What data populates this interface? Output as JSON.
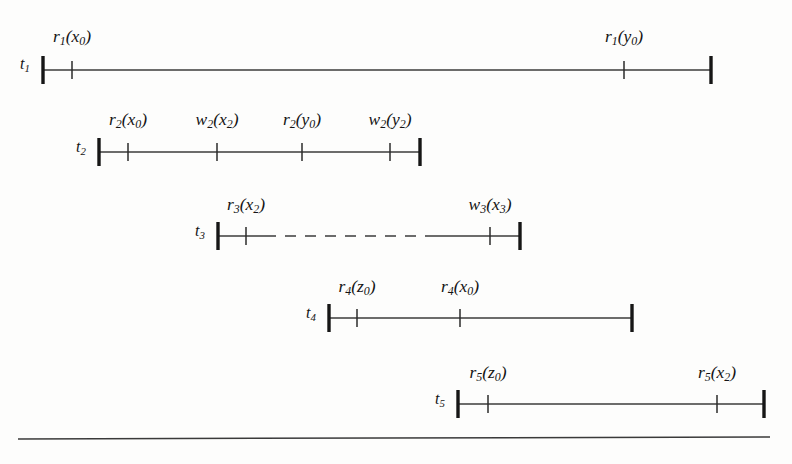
{
  "figure": {
    "type": "timeline-schedule-diagram",
    "background_color": "#fdfdfc",
    "line_color": "#3b3b3b",
    "endcap_color": "#161616",
    "width": 792,
    "height": 464,
    "bottom_rule": {
      "x1": 18,
      "y1": 439,
      "x2": 770,
      "y2": 437
    },
    "timelines": [
      {
        "id": "t1",
        "row_label": "t",
        "row_sub": "1",
        "row_label_x": 20,
        "row_label_y": 56,
        "baseline_y": 70,
        "x_start": 43,
        "x_end": 711,
        "dashed_segment": null,
        "events": [
          {
            "op": "r",
            "op_sub": "1",
            "arg": "x",
            "arg_sub": "0",
            "x": 72,
            "label_y": 28
          },
          {
            "op": "r",
            "op_sub": "1",
            "arg": "y",
            "arg_sub": "0",
            "x": 624,
            "label_y": 28
          }
        ]
      },
      {
        "id": "t2",
        "row_label": "t",
        "row_sub": "2",
        "row_label_x": 76,
        "row_label_y": 139,
        "baseline_y": 152,
        "x_start": 99,
        "x_end": 420,
        "dashed_segment": null,
        "events": [
          {
            "op": "r",
            "op_sub": "2",
            "arg": "x",
            "arg_sub": "0",
            "x": 128,
            "label_y": 111
          },
          {
            "op": "w",
            "op_sub": "2",
            "arg": "x",
            "arg_sub": "2",
            "x": 217,
            "label_y": 111
          },
          {
            "op": "r",
            "op_sub": "2",
            "arg": "y",
            "arg_sub": "0",
            "x": 302,
            "label_y": 111
          },
          {
            "op": "w",
            "op_sub": "2",
            "arg": "y",
            "arg_sub": "2",
            "x": 390,
            "label_y": 111
          }
        ]
      },
      {
        "id": "t3",
        "row_label": "t",
        "row_sub": "3",
        "row_label_x": 195,
        "row_label_y": 223,
        "baseline_y": 236,
        "x_start": 218,
        "x_end": 520,
        "dashed_segment": {
          "x1": 265,
          "x2": 428
        },
        "events": [
          {
            "op": "r",
            "op_sub": "3",
            "arg": "x",
            "arg_sub": "2",
            "x": 246,
            "label_y": 196
          },
          {
            "op": "w",
            "op_sub": "3",
            "arg": "x",
            "arg_sub": "3",
            "x": 490,
            "label_y": 196
          }
        ]
      },
      {
        "id": "t4",
        "row_label": "t",
        "row_sub": "4",
        "row_label_x": 306,
        "row_label_y": 305,
        "baseline_y": 318,
        "x_start": 329,
        "x_end": 632,
        "dashed_segment": null,
        "events": [
          {
            "op": "r",
            "op_sub": "4",
            "arg": "z",
            "arg_sub": "0",
            "x": 357,
            "label_y": 278
          },
          {
            "op": "r",
            "op_sub": "4",
            "arg": "x",
            "arg_sub": "0",
            "x": 460,
            "label_y": 278
          }
        ]
      },
      {
        "id": "t5",
        "row_label": "t",
        "row_sub": "5",
        "row_label_x": 435,
        "row_label_y": 391,
        "baseline_y": 404,
        "x_start": 458,
        "x_end": 764,
        "dashed_segment": null,
        "events": [
          {
            "op": "r",
            "op_sub": "5",
            "arg": "z",
            "arg_sub": "0",
            "x": 488,
            "label_y": 364
          },
          {
            "op": "r",
            "op_sub": "5",
            "arg": "x",
            "arg_sub": "2",
            "x": 717,
            "label_y": 364
          }
        ]
      }
    ]
  }
}
